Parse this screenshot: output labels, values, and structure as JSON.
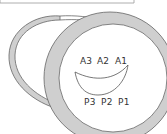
{
  "diagram": {
    "anterior_labels": [
      "A3",
      "A2",
      "A1"
    ],
    "posterior_labels": [
      "P3",
      "P2",
      "P1"
    ],
    "colors": {
      "ring_fill": "#cfcfcf",
      "stroke": "#555555",
      "inner_fill": "#ffffff"
    }
  }
}
